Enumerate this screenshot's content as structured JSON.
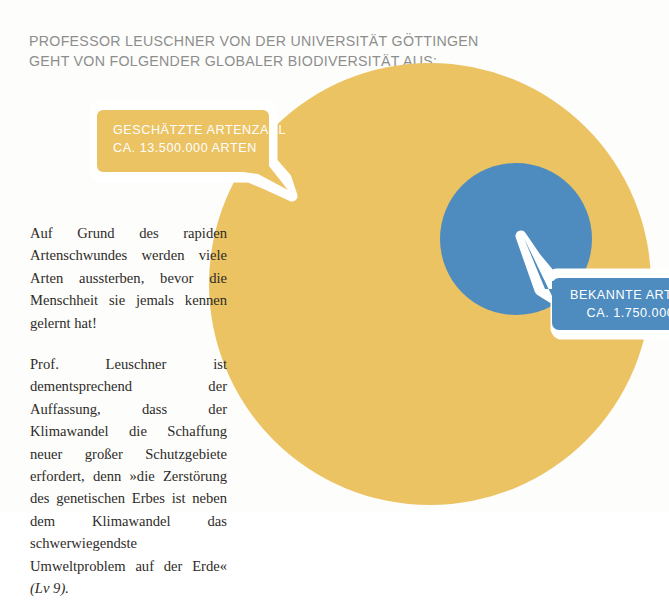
{
  "headline": {
    "line1": "PROFESSOR LEUSCHNER VON DER UNIVERSITÄT GÖTTINGEN",
    "line2": "GEHT VON FOLGENDER GLOBALER BIODIVERSITÄT AUS:"
  },
  "callouts": {
    "estimated": {
      "title": "GESCHÄTZTE ARTENZAHL",
      "value": "CA. 13.500.000 ARTEN",
      "color": "#ebc363"
    },
    "known": {
      "title": "BEKANNTE ARTEN",
      "value": "CA. 1.750.000",
      "color": "#4e8cc0"
    }
  },
  "body": {
    "paragraph1": "Auf Grund des rapiden Artenschwundes werden viele Arten aussterben, bevor die Menschheit sie jemals kennen gelernt hat!",
    "paragraph2_main": "Prof. Leuschner ist dementsprechend der Auffassung, dass der Klimawandel die Schaffung neuer großer Schutzgebiete erfordert, denn »die Zerstörung des genetischen Erbes ist neben dem Klimawandel das schwerwiegendste Umweltproblem auf der Erde«",
    "paragraph2_source": "(Lv 9)."
  },
  "chart_data": {
    "type": "pie",
    "categories": [
      "Geschätzte Artenzahl",
      "Bekannte Arten"
    ],
    "values": [
      13500000,
      1750000
    ],
    "value_labels": [
      "CA. 13.500.000 ARTEN",
      "CA. 1.750.000"
    ],
    "colors": [
      "#ebc363",
      "#4e8cc0"
    ],
    "representation": "nested proportional area circles",
    "outer_circle": {
      "label": "Geschätzte Artenzahl",
      "value": 13500000,
      "cx": 430,
      "cy": 284,
      "r": 221,
      "color": "#ebc363"
    },
    "inner_circle": {
      "label": "Bekannte Arten",
      "value": 1750000,
      "cx": 516,
      "cy": 239,
      "r": 76,
      "color": "#4e8cc0"
    },
    "xlabel": "",
    "ylabel": "",
    "legend": "callout bubbles"
  }
}
